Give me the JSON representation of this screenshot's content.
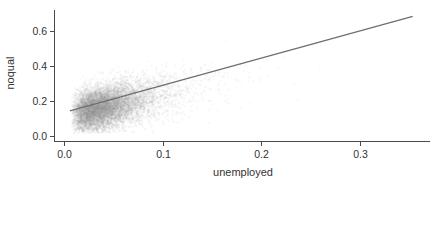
{
  "chart_data": {
    "type": "scatter",
    "title": "",
    "xlabel": "unemployed",
    "ylabel": "noqual",
    "xlim": [
      -0.0065,
      0.372
    ],
    "ylim": [
      -0.03,
      0.72
    ],
    "x_ticks": [
      0.0,
      0.1,
      0.2,
      0.3
    ],
    "x_tick_labels": [
      "0.0",
      "0.1",
      "0.2",
      "0.3"
    ],
    "y_ticks": [
      0.0,
      0.2,
      0.4,
      0.6
    ],
    "y_tick_labels": [
      "0.0",
      "0.2",
      "0.4",
      "0.6"
    ],
    "grid": false,
    "legend": null,
    "series": [
      {
        "name": "observations",
        "kind": "scatter-cloud",
        "color": "#9a9a9a",
        "opacity": 0.08,
        "point_count": 9000,
        "description": "Dense cloud of semi-transparent points; densest near unemployed 0.02-0.08, noqual 0.1-0.35; fans out and thins toward unemployed 0.25",
        "x_range": [
          0.008,
          0.26
        ],
        "y_range": [
          0.015,
          0.55
        ],
        "density_profile": {
          "x_mode": 0.04,
          "x_scale": 0.035,
          "y_center_intercept": 0.16,
          "y_center_slope": 1.25,
          "y_spread_base": 0.06,
          "y_spread_slope": 0.25
        }
      },
      {
        "name": "fitted line",
        "kind": "line",
        "color": "#6e6e6e",
        "x": [
          0.006,
          0.354
        ],
        "y": [
          0.143,
          0.683
        ],
        "slope": 1.552,
        "intercept": 0.134
      }
    ]
  }
}
